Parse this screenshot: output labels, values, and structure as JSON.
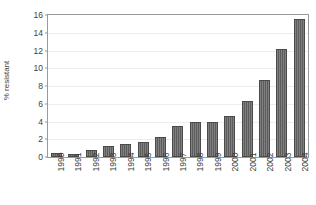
{
  "chart_data": {
    "type": "bar",
    "title": "",
    "xlabel": "",
    "ylabel": "% resistant",
    "ylim": [
      0,
      16
    ],
    "yticks": [
      0,
      2,
      4,
      6,
      8,
      10,
      12,
      14,
      16
    ],
    "ytick_labels": [
      "0",
      "2",
      "4",
      "6",
      "8",
      "10",
      "12",
      "14",
      "16"
    ],
    "grid": true,
    "legend": "none",
    "bar_color": "#5c5c5c",
    "categories": [
      "1990",
      "1991",
      "1992",
      "1993",
      "1994",
      "1995",
      "1996",
      "1997",
      "1998",
      "1999",
      "2000",
      "2001",
      "2002",
      "2003",
      "2004"
    ],
    "values": [
      0.5,
      0.3,
      0.8,
      1.2,
      1.5,
      1.7,
      2.2,
      3.5,
      4.0,
      3.9,
      4.6,
      6.3,
      8.7,
      12.2,
      15.6
    ]
  }
}
